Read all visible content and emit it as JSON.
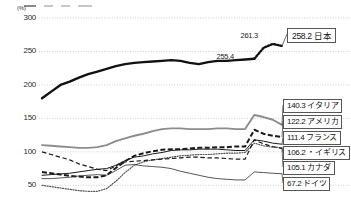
{
  "chart_data": {
    "type": "line",
    "title": "",
    "xlabel": "",
    "ylabel": "",
    "yunit": "(%)",
    "ylim": [
      40,
      300
    ],
    "yticks": [
      300,
      250,
      200,
      150,
      100,
      50
    ],
    "xlim": [
      0,
      26
    ],
    "grid": true,
    "legend_position": "right-callouts",
    "annotations": [
      {
        "text": "255.4",
        "x": 20.0,
        "y": 255.4
      },
      {
        "text": "261.3",
        "x": 22.6,
        "y": 261.3
      }
    ],
    "series": [
      {
        "name": "日本",
        "label": "258.2 日本",
        "value": "258.2",
        "color": "#111111",
        "style": "solid-thick",
        "x": [
          0,
          1,
          2,
          3,
          4,
          5,
          6,
          7,
          8,
          9,
          10,
          11,
          12,
          13,
          14,
          15,
          16,
          17,
          18,
          19,
          20,
          21,
          22,
          23,
          24,
          25,
          26
        ],
        "values": [
          180,
          190,
          200,
          205,
          211,
          216,
          220,
          224,
          228,
          231,
          233,
          234,
          235,
          236,
          237,
          236,
          233,
          231,
          234,
          236,
          236,
          237,
          238,
          239,
          255.4,
          261.3,
          258.2
        ]
      },
      {
        "name": "イタリア",
        "label": "140.3 イタリア",
        "value": "140.3",
        "color": "#8c8c8c",
        "style": "solid-medium",
        "x": [
          0,
          1,
          2,
          3,
          4,
          5,
          6,
          7,
          8,
          9,
          10,
          11,
          12,
          13,
          14,
          15,
          16,
          17,
          18,
          19,
          20,
          21,
          22,
          23,
          24,
          25,
          26
        ],
        "values": [
          110,
          109,
          108,
          107,
          106,
          106,
          107,
          110,
          116,
          120,
          124,
          127,
          131,
          134,
          135,
          135,
          134,
          134,
          134,
          135,
          135,
          134,
          134,
          155,
          152,
          148,
          140.3
        ]
      },
      {
        "name": "アメリカ",
        "label": "122.2 アメリカ",
        "value": "122.2",
        "color": "#1a1a1a",
        "style": "dashed-thick",
        "x": [
          0,
          1,
          2,
          3,
          4,
          5,
          6,
          7,
          8,
          9,
          10,
          11,
          12,
          13,
          14,
          15,
          16,
          17,
          18,
          19,
          20,
          21,
          22,
          23,
          24,
          25,
          26
        ],
        "values": [
          70,
          68,
          66,
          64,
          63,
          62,
          62,
          65,
          76,
          86,
          94,
          98,
          101,
          103,
          104,
          104,
          105,
          106,
          106,
          107,
          107,
          108,
          108,
          133,
          127,
          124,
          122.2
        ]
      },
      {
        "name": "フランス",
        "label": "111.4 フランス",
        "value": "111.4",
        "color": "#1a1a1a",
        "style": "solid-thin",
        "x": [
          0,
          1,
          2,
          3,
          4,
          5,
          6,
          7,
          8,
          9,
          10,
          11,
          12,
          13,
          14,
          15,
          16,
          17,
          18,
          19,
          20,
          21,
          22,
          23,
          24,
          25,
          26
        ],
        "values": [
          65,
          66,
          67,
          68,
          70,
          72,
          74,
          75,
          80,
          87,
          92,
          94,
          97,
          99,
          102,
          103,
          103,
          104,
          104,
          104,
          103,
          102,
          102,
          118,
          116,
          113,
          111.4
        ]
      },
      {
        "name": "イギリス",
        "label": "106.2 ・イギリス",
        "value": "106.2",
        "color": "#555555",
        "style": "dotted",
        "x": [
          0,
          1,
          2,
          3,
          4,
          5,
          6,
          7,
          8,
          9,
          10,
          11,
          12,
          13,
          14,
          15,
          16,
          17,
          18,
          19,
          20,
          21,
          22,
          23,
          24,
          25,
          26
        ],
        "values": [
          50,
          48,
          46,
          44,
          42,
          41,
          41,
          45,
          56,
          69,
          80,
          85,
          88,
          90,
          92,
          94,
          95,
          96,
          96,
          97,
          98,
          98,
          99,
          113,
          109,
          107,
          106.2
        ]
      },
      {
        "name": "カナダ",
        "label": "105.1 カナダ",
        "value": "105.1",
        "color": "#1a1a1a",
        "style": "dashed-thin",
        "x": [
          0,
          1,
          2,
          3,
          4,
          5,
          6,
          7,
          8,
          9,
          10,
          11,
          12,
          13,
          14,
          15,
          16,
          17,
          18,
          19,
          20,
          21,
          22,
          23,
          24,
          25,
          26
        ],
        "values": [
          100,
          96,
          92,
          88,
          82,
          78,
          74,
          72,
          79,
          85,
          86,
          87,
          88,
          89,
          90,
          91,
          92,
          92,
          91,
          91,
          90,
          89,
          89,
          118,
          112,
          108,
          105.1
        ]
      },
      {
        "name": "ドイツ",
        "label": "67.2 ドイツ",
        "value": "67.2",
        "color": "#2b2b2b",
        "style": "solid-hairline",
        "x": [
          0,
          1,
          2,
          3,
          4,
          5,
          6,
          7,
          8,
          9,
          10,
          11,
          12,
          13,
          14,
          15,
          16,
          17,
          18,
          19,
          20,
          21,
          22,
          23,
          24,
          25,
          26
        ],
        "values": [
          60,
          60,
          61,
          62,
          64,
          65,
          66,
          65,
          72,
          80,
          81,
          79,
          78,
          77,
          75,
          71,
          68,
          65,
          62,
          60,
          59,
          58,
          58,
          70,
          69,
          68,
          67.2
        ]
      }
    ]
  },
  "legend_strip": {
    "items": [
      "",
      "",
      "",
      ""
    ]
  }
}
